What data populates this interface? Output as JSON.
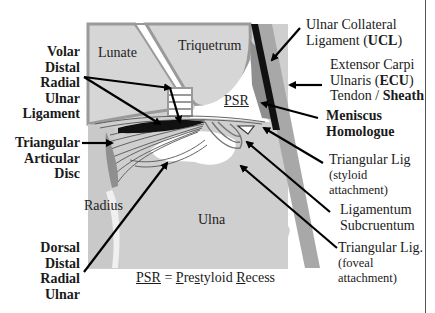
{
  "figure": {
    "bones": {
      "lunate": "Lunate",
      "triquetrum": "Triquetrum",
      "radius": "Radius",
      "ulna": "Ulna",
      "psr": "PSR"
    },
    "left_labels": {
      "volar_drul": [
        "Volar",
        "Distal",
        "Radial",
        "Ulnar",
        "Ligament"
      ],
      "tad": [
        "Triangular",
        "Articular",
        "Disc"
      ],
      "dorsal_drul": [
        "Dorsal",
        "Distal",
        "Radial",
        "Ulnar"
      ]
    },
    "right_labels": {
      "ucl_line1": "Ulnar Collateral",
      "ucl_line2_prefix": "Ligament (",
      "ucl_abbr": "UCL",
      "ucl_line2_suffix": ")",
      "ecu_line1": "Extensor Carpi",
      "ecu_line2_prefix": "Ulnaris (",
      "ecu_abbr": "ECU",
      "ecu_line2_suffix": ")",
      "ecu_line3_prefix": "Tendon / ",
      "ecu_line3_bold": "Sheath",
      "meniscus": [
        "Meniscus",
        "Homologue"
      ],
      "tri_styloid": [
        "Triangular Lig",
        "(styloid",
        "attachment)"
      ],
      "lig_sub": [
        "Ligamentum",
        "Subcruentum"
      ],
      "tri_foveal": [
        "Triangular Lig.",
        "(foveal",
        "attachment)"
      ]
    },
    "legend": {
      "abbr": "PSR",
      "equals": " = ",
      "p": "P",
      "re": "re",
      "s": "s",
      "tyloid": "tyloid ",
      "r": "R",
      "ecess": "ecess"
    },
    "colors": {
      "bone_fill": "#d2d2d2",
      "bone_edge": "#9c9c9c",
      "background_panel": "#c8c8c8",
      "ecu_band": "#a8a8a8",
      "ligament_dark": "#111111",
      "arrow": "#000000"
    }
  }
}
